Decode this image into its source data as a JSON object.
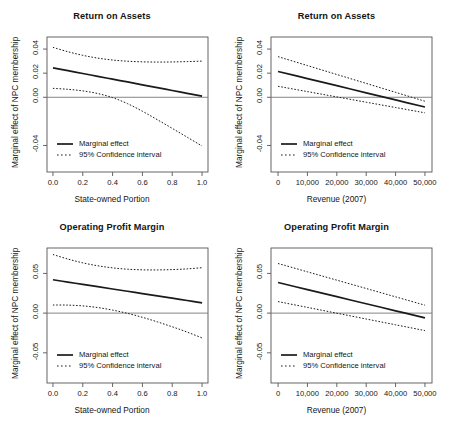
{
  "figure": {
    "background": "#ffffff",
    "line_color": "#1a1a1a",
    "axis_color": "#555555",
    "zero_line_color": "#777777"
  },
  "common": {
    "ylabel": "Marginal effect of NPC membership",
    "legend": {
      "marginal": "Marginal effect",
      "ci": "95% Confidence interval"
    }
  },
  "chart_data": [
    {
      "id": "roa-state",
      "type": "line",
      "title": "Return on Assets",
      "xlabel": "State-owned Portion",
      "ylabel": "Marginal effect of NPC membership",
      "xticks": [
        "0.0",
        "0.2",
        "0.4",
        "0.6",
        "0.8",
        "1.0"
      ],
      "xtick_values": [
        0.0,
        0.2,
        0.4,
        0.6,
        0.8,
        1.0
      ],
      "yticks": [
        "0.04",
        "0.02",
        "0.00",
        "-0.04"
      ],
      "ytick_values": [
        0.04,
        0.02,
        0.0,
        -0.04
      ],
      "xlim": [
        -0.04,
        1.04
      ],
      "ylim": [
        -0.062,
        0.05
      ],
      "grid": false,
      "zero_line": 0.0,
      "legend_position": "bottom-left",
      "x": [
        0.0,
        0.1,
        0.2,
        0.3,
        0.4,
        0.5,
        0.6,
        0.7,
        0.8,
        0.9,
        1.0
      ],
      "series": [
        {
          "name": "Marginal effect",
          "style": "solid",
          "values": [
            0.0244,
            0.0221,
            0.0197,
            0.0174,
            0.015,
            0.0127,
            0.0103,
            0.008,
            0.0056,
            0.0033,
            0.0009
          ]
        },
        {
          "name": "Upper 95% CI",
          "style": "dotted",
          "values": [
            0.0414,
            0.0378,
            0.0348,
            0.0325,
            0.0309,
            0.0299,
            0.0294,
            0.0292,
            0.0293,
            0.0296,
            0.03
          ]
        },
        {
          "name": "Lower 95% CI",
          "style": "dotted",
          "values": [
            0.0074,
            0.0066,
            0.0053,
            0.0031,
            -0.0003,
            -0.0053,
            -0.0116,
            -0.0186,
            -0.0258,
            -0.0331,
            -0.0404
          ]
        }
      ]
    },
    {
      "id": "roa-revenue",
      "type": "line",
      "title": "Return on Assets",
      "xlabel": "Revenue (2007)",
      "ylabel": "Marginal effect of NPC membership",
      "xticks": [
        "0",
        "10,000",
        "20,000",
        "30,000",
        "40,000",
        "50,000"
      ],
      "xtick_values": [
        0,
        10000,
        20000,
        30000,
        40000,
        50000
      ],
      "yticks": [
        "0.04",
        "0.02",
        "0.00",
        "-0.04"
      ],
      "ytick_values": [
        0.04,
        0.02,
        0.0,
        -0.04
      ],
      "xlim": [
        -2400,
        52400
      ],
      "ylim": [
        -0.062,
        0.05
      ],
      "grid": false,
      "zero_line": 0.0,
      "legend_position": "bottom-left",
      "x": [
        0,
        10000,
        20000,
        30000,
        40000,
        50000
      ],
      "series": [
        {
          "name": "Marginal effect",
          "style": "solid",
          "values": [
            0.0214,
            0.0155,
            0.0096,
            0.0037,
            -0.0022,
            -0.0081
          ]
        },
        {
          "name": "Upper 95% CI",
          "style": "dotted",
          "values": [
            0.0337,
            0.0263,
            0.0189,
            0.0115,
            0.0041,
            -0.0033
          ]
        },
        {
          "name": "Lower 95% CI",
          "style": "dotted",
          "values": [
            0.0091,
            0.0047,
            0.0003,
            -0.0041,
            -0.0085,
            -0.0129
          ]
        }
      ]
    },
    {
      "id": "opm-state",
      "type": "line",
      "title": "Operating Profit Margin",
      "xlabel": "State-owned Portion",
      "ylabel": "Marginal effect of NPC membership",
      "xticks": [
        "0.0",
        "0.2",
        "0.4",
        "0.6",
        "0.8",
        "1.0"
      ],
      "xtick_values": [
        0.0,
        0.2,
        0.4,
        0.6,
        0.8,
        1.0
      ],
      "yticks": [
        "0.05",
        "0.00",
        "-0.05"
      ],
      "ytick_values": [
        0.05,
        0.0,
        -0.05
      ],
      "xlim": [
        -0.04,
        1.04
      ],
      "ylim": [
        -0.088,
        0.082
      ],
      "grid": false,
      "zero_line": 0.0,
      "legend_position": "bottom-left",
      "x": [
        0.0,
        0.1,
        0.2,
        0.3,
        0.4,
        0.5,
        0.6,
        0.7,
        0.8,
        0.9,
        1.0
      ],
      "series": [
        {
          "name": "Marginal effect",
          "style": "solid",
          "values": [
            0.042,
            0.0391,
            0.0362,
            0.0333,
            0.0304,
            0.0275,
            0.0246,
            0.0217,
            0.0188,
            0.0159,
            0.013
          ]
        },
        {
          "name": "Upper 95% CI",
          "style": "dotted",
          "values": [
            0.0738,
            0.0681,
            0.0633,
            0.0596,
            0.057,
            0.0553,
            0.0545,
            0.0544,
            0.0548,
            0.0557,
            0.0572
          ]
        },
        {
          "name": "Lower 95% CI",
          "style": "dotted",
          "values": [
            0.0102,
            0.0101,
            0.0091,
            0.007,
            0.0038,
            -0.0003,
            -0.0053,
            -0.011,
            -0.0172,
            -0.0239,
            -0.0312
          ]
        }
      ]
    },
    {
      "id": "opm-revenue",
      "type": "line",
      "title": "Operating Profit Margin",
      "xlabel": "Revenue (2007)",
      "ylabel": "Marginal effect of NPC membership",
      "xticks": [
        "0",
        "10,000",
        "20,000",
        "30,000",
        "40,000",
        "50,000"
      ],
      "xtick_values": [
        0,
        10000,
        20000,
        30000,
        40000,
        50000
      ],
      "yticks": [
        "0.05",
        "0.00",
        "-0.05"
      ],
      "ytick_values": [
        0.05,
        0.0,
        -0.05
      ],
      "xlim": [
        -2400,
        52400
      ],
      "ylim": [
        -0.088,
        0.082
      ],
      "grid": false,
      "zero_line": 0.0,
      "legend_position": "bottom-left",
      "x": [
        0,
        10000,
        20000,
        30000,
        40000,
        50000
      ],
      "series": [
        {
          "name": "Marginal effect",
          "style": "solid",
          "values": [
            0.0385,
            0.0296,
            0.0207,
            0.0118,
            0.0029,
            -0.006
          ]
        },
        {
          "name": "Upper 95% CI",
          "style": "dotted",
          "values": [
            0.0625,
            0.052,
            0.0415,
            0.031,
            0.0205,
            0.01
          ]
        },
        {
          "name": "Lower 95% CI",
          "style": "dotted",
          "values": [
            0.0145,
            0.0072,
            -0.0001,
            -0.0074,
            -0.0147,
            -0.022
          ]
        }
      ]
    }
  ]
}
